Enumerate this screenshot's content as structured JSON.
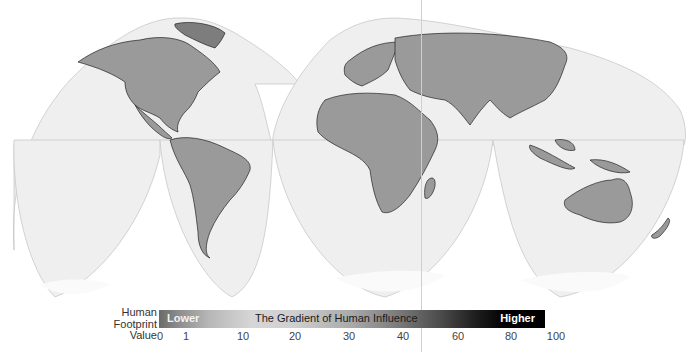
{
  "map": {
    "projection": "interrupted-goode-homolosine",
    "land_color": "#9a9a9a",
    "ocean_color": "#efefef",
    "border_color": "#222222",
    "outline_color": "#c8c8c8"
  },
  "legend": {
    "label_line1": "Human",
    "label_line2": "Footprint",
    "label_line3": "Value",
    "lower_label": "Lower",
    "title": "The Gradient of Human Influence",
    "higher_label": "Higher",
    "ticks": [
      {
        "value": "0",
        "x": 160
      },
      {
        "value": "1",
        "x": 186
      },
      {
        "value": "10",
        "x": 243
      },
      {
        "value": "20",
        "x": 295
      },
      {
        "value": "30",
        "x": 349
      },
      {
        "value": "40",
        "x": 403
      },
      {
        "value": "60",
        "x": 458
      },
      {
        "value": "80",
        "x": 511
      },
      {
        "value": "100",
        "x": 556
      }
    ]
  }
}
